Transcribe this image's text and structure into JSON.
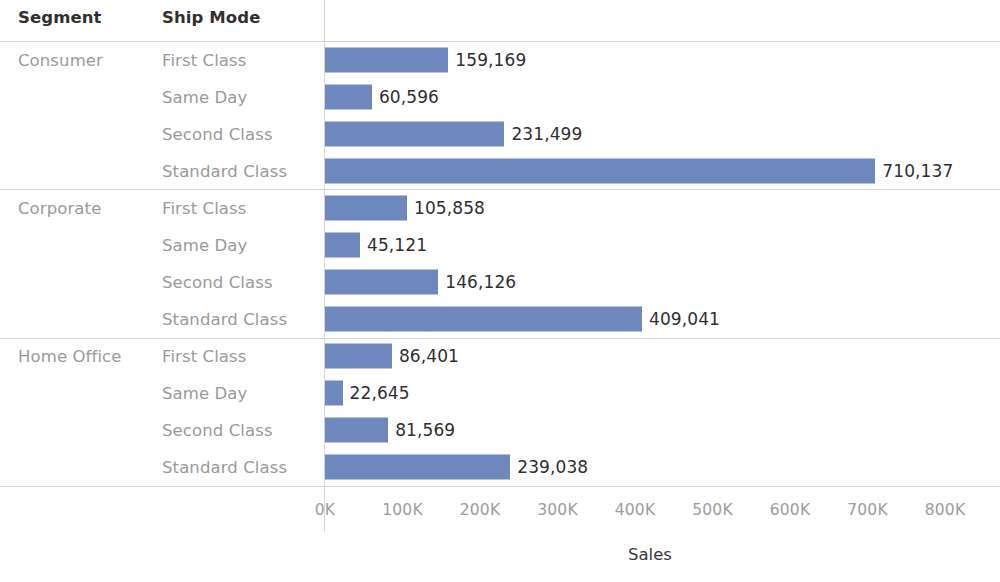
{
  "header": {
    "col_segment": "Segment",
    "col_ship_mode": "Ship Mode"
  },
  "axis": {
    "title": "Sales",
    "ticks": [
      "0K",
      "100K",
      "200K",
      "300K",
      "400K",
      "500K",
      "600K",
      "700K",
      "800K"
    ],
    "tick_values": [
      0,
      100000,
      200000,
      300000,
      400000,
      500000,
      600000,
      700000,
      800000
    ]
  },
  "colors": {
    "bar": "#6e87bd",
    "header_text": "#303030",
    "row_label": "#9a9a9a",
    "value_text": "#2f2f2f",
    "rule": "#d4d4d4",
    "background": "#ffffff"
  },
  "rows": [
    {
      "segment": "Consumer",
      "ship_mode": "First Class",
      "value": 159169,
      "label": "159,169",
      "group_start": true
    },
    {
      "segment": "",
      "ship_mode": "Same Day",
      "value": 60596,
      "label": "60,596",
      "group_start": false
    },
    {
      "segment": "",
      "ship_mode": "Second Class",
      "value": 231499,
      "label": "231,499",
      "group_start": false
    },
    {
      "segment": "",
      "ship_mode": "Standard Class",
      "value": 710137,
      "label": "710,137",
      "group_start": false
    },
    {
      "segment": "Corporate",
      "ship_mode": "First Class",
      "value": 105858,
      "label": "105,858",
      "group_start": true
    },
    {
      "segment": "",
      "ship_mode": "Same Day",
      "value": 45121,
      "label": "45,121",
      "group_start": false
    },
    {
      "segment": "",
      "ship_mode": "Second Class",
      "value": 146126,
      "label": "146,126",
      "group_start": false
    },
    {
      "segment": "",
      "ship_mode": "Standard Class",
      "value": 409041,
      "label": "409,041",
      "group_start": false
    },
    {
      "segment": "Home Office",
      "ship_mode": "First Class",
      "value": 86401,
      "label": "86,401",
      "group_start": true
    },
    {
      "segment": "",
      "ship_mode": "Same Day",
      "value": 22645,
      "label": "22,645",
      "group_start": false
    },
    {
      "segment": "",
      "ship_mode": "Second Class",
      "value": 81569,
      "label": "81,569",
      "group_start": false
    },
    {
      "segment": "",
      "ship_mode": "Standard Class",
      "value": 239038,
      "label": "239,038",
      "group_start": false
    }
  ],
  "chart_data": {
    "type": "bar",
    "orientation": "horizontal",
    "title": "",
    "xlabel": "Sales",
    "ylabel": "",
    "xlim": [
      0,
      800000
    ],
    "grid": false,
    "legend": "none",
    "categories": [
      "Consumer - First Class",
      "Consumer - Same Day",
      "Consumer - Second Class",
      "Consumer - Standard Class",
      "Corporate - First Class",
      "Corporate - Same Day",
      "Corporate - Second Class",
      "Corporate - Standard Class",
      "Home Office - First Class",
      "Home Office - Same Day",
      "Home Office - Second Class",
      "Home Office - Standard Class"
    ],
    "values": [
      159169,
      60596,
      231499,
      710137,
      105858,
      45121,
      146126,
      409041,
      86401,
      22645,
      81569,
      239038
    ],
    "data_labels": [
      "159,169",
      "60,596",
      "231,499",
      "710,137",
      "105,858",
      "45,121",
      "146,126",
      "409,041",
      "86,401",
      "22,645",
      "81,569",
      "239,038"
    ],
    "xtick_labels": [
      "0K",
      "100K",
      "200K",
      "300K",
      "400K",
      "500K",
      "600K",
      "700K",
      "800K"
    ],
    "xtick_values": [
      0,
      100000,
      200000,
      300000,
      400000,
      500000,
      600000,
      700000,
      800000
    ],
    "group_by": [
      "Segment",
      "Ship Mode"
    ],
    "groups": [
      {
        "name": "Consumer",
        "categories": [
          "First Class",
          "Same Day",
          "Second Class",
          "Standard Class"
        ],
        "values": [
          159169,
          60596,
          231499,
          710137
        ]
      },
      {
        "name": "Corporate",
        "categories": [
          "First Class",
          "Same Day",
          "Second Class",
          "Standard Class"
        ],
        "values": [
          105858,
          45121,
          146126,
          409041
        ]
      },
      {
        "name": "Home Office",
        "categories": [
          "First Class",
          "Same Day",
          "Second Class",
          "Standard Class"
        ],
        "values": [
          86401,
          22645,
          81569,
          239038
        ]
      }
    ]
  }
}
